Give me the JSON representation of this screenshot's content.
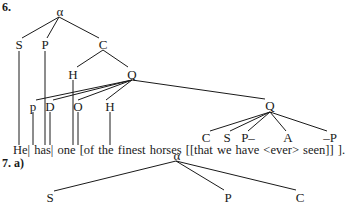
{
  "example6": {
    "number": "6.",
    "root": "α",
    "level1": [
      "S",
      "P",
      "C"
    ],
    "c_children": [
      "H",
      "Q"
    ],
    "q_children": [
      "p",
      "D",
      "O",
      "H",
      "Q"
    ],
    "inner_q_children": [
      "C",
      "S",
      "P–",
      "A",
      "–P"
    ],
    "sentence": "He| has| one [of the finest horses [[that we have <ever> seen]] ]."
  },
  "example7": {
    "number": "7.  a)",
    "root": "α",
    "children": [
      "S",
      "P",
      "C"
    ]
  },
  "colors": {
    "ink": "#1a1a1a",
    "background": "#ffffff"
  }
}
